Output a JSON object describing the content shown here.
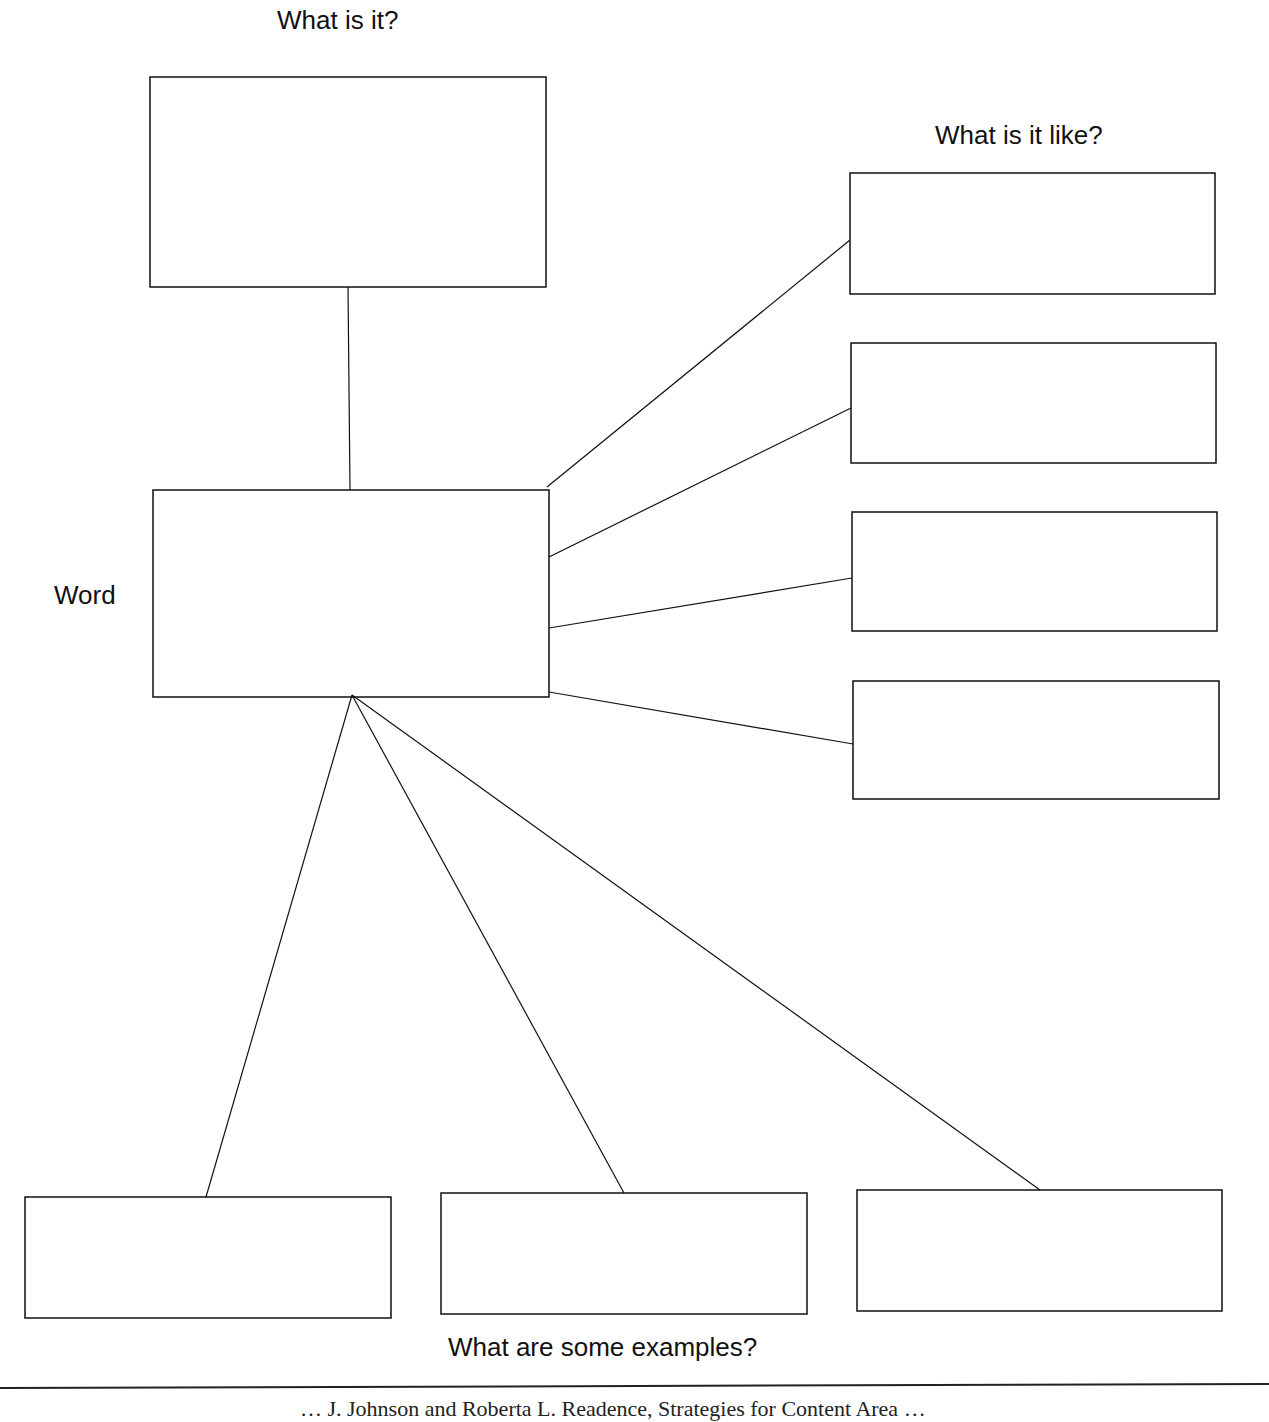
{
  "diagram": {
    "type": "word-map graphic organizer",
    "labels": {
      "top": "What is it?",
      "right": "What is it like?",
      "left": "Word",
      "bottom": "What are some examples?"
    },
    "boxes": {
      "definition": {
        "x1": 150,
        "y1": 77,
        "x2": 546,
        "y2": 287
      },
      "word": {
        "x1": 153,
        "y1": 490,
        "x2": 549,
        "y2": 697
      },
      "properties": [
        {
          "x1": 850,
          "y1": 173,
          "x2": 1215,
          "y2": 294
        },
        {
          "x1": 851,
          "y1": 343,
          "x2": 1216,
          "y2": 463
        },
        {
          "x1": 852,
          "y1": 512,
          "x2": 1217,
          "y2": 631
        },
        {
          "x1": 853,
          "y1": 681,
          "x2": 1219,
          "y2": 799
        }
      ],
      "examples": [
        {
          "x1": 25,
          "y1": 1197,
          "x2": 391,
          "y2": 1318
        },
        {
          "x1": 441,
          "y1": 1193,
          "x2": 807,
          "y2": 1314
        },
        {
          "x1": 857,
          "y1": 1190,
          "x2": 1222,
          "y2": 1311
        }
      ]
    },
    "connectors": [
      {
        "from": "definition",
        "x1": 348,
        "y1": 287,
        "x2": 350,
        "y2": 490
      },
      {
        "from": "word",
        "x1": 547,
        "y1": 487,
        "x2": 850,
        "y2": 240
      },
      {
        "from": "word",
        "x1": 549,
        "y1": 557,
        "x2": 851,
        "y2": 408
      },
      {
        "from": "word",
        "x1": 549,
        "y1": 628,
        "x2": 852,
        "y2": 578
      },
      {
        "from": "word",
        "x1": 549,
        "y1": 692,
        "x2": 853,
        "y2": 744
      },
      {
        "from": "word",
        "x1": 352,
        "y1": 695,
        "x2": 206,
        "y2": 1197
      },
      {
        "from": "word",
        "x1": 352,
        "y1": 695,
        "x2": 624,
        "y2": 1193
      },
      {
        "from": "word",
        "x1": 352,
        "y1": 695,
        "x2": 1040,
        "y2": 1190
      }
    ]
  },
  "footer": {
    "text": "… J. Johnson and Roberta L. Readence, Strategies for Content Area …"
  },
  "colors": {
    "line": "#111111",
    "background": "#ffffff"
  }
}
